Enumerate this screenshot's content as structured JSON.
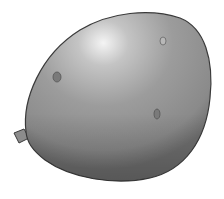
{
  "image": {
    "subject": "gray balloon",
    "colors": {
      "background": "#ffffff",
      "body": "#9a9a9a",
      "highlight": "#f2f2f2",
      "shadow": "#6e6e6e",
      "outline": "#3a3a3a"
    },
    "spots": [
      {
        "name": "spot-left",
        "x": 57,
        "y": 77
      },
      {
        "name": "spot-top-right",
        "x": 163,
        "y": 41
      },
      {
        "name": "spot-lower-right",
        "x": 157,
        "y": 114
      }
    ]
  }
}
